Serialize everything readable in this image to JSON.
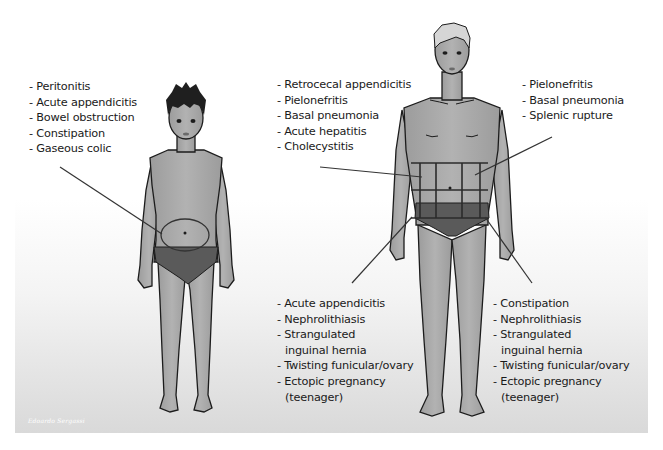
{
  "diagram": {
    "colors": {
      "skin": "#a9a9a9",
      "outline": "#1c1c1c",
      "underwear": "#5a5a5a",
      "child_hair": "#1f1f1f",
      "adult_hair": "#d6d6d6",
      "text": "#1a1a1a",
      "leader_line": "#333333"
    },
    "child": {
      "label_region": "periumbilical",
      "conditions": [
        "- Peritonitis",
        "- Acute appendicitis",
        "- Bowel obstruction",
        "- Constipation",
        "- Gaseous colic"
      ]
    },
    "adult": {
      "right_upper": {
        "conditions": [
          "- Retrocecal appendicitis",
          "- Pielonefritis",
          "- Basal pneumonia",
          "- Acute hepatitis",
          "- Cholecystitis"
        ]
      },
      "left_upper": {
        "conditions": [
          "- Pielonefritis",
          "- Basal pneumonia",
          "- Splenic rupture"
        ]
      },
      "right_lower": {
        "conditions": [
          "- Acute appendicitis",
          "- Nephrolithiasis",
          "- Strangulated",
          "inguinal hernia",
          "- Twisting funicular/ovary",
          "- Ectopic pregnancy",
          "(teenager)"
        ]
      },
      "left_lower": {
        "conditions": [
          "- Constipation",
          "- Nephrolithiasis",
          "- Strangulated",
          "inguinal hernia",
          "- Twisting funicular/ovary",
          "- Ectopic pregnancy",
          "(teenager)"
        ]
      }
    },
    "signature": "Edoardo Sergassi"
  }
}
